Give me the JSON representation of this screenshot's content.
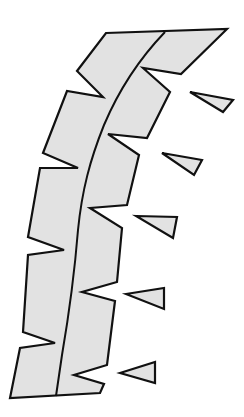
{
  "diagram": {
    "colors": {
      "fill": "#e2e2e2",
      "stroke": "#111111",
      "background": "#ffffff"
    },
    "strip": {
      "outline": "106,33 227,29 181,74 143,68 170,92 147,138 108,134 139,155 127,205 90,208 122,228 117,282 82,292 115,301 107,365 74,375 104,384 100,393 10,398 20,348 55,343 23,332 28,255 64,250 28,237 40,168 78,168 43,153 67,91 103,97 77,71",
      "center_line": "M165,32 C140,58 118,92 104,125 C90,160 82,190 78,230 C74,280 68,320 62,355 L56,396"
    },
    "triangles": [
      {
        "points": "190,92 233,100 223,112"
      },
      {
        "points": "162,153 202,160 194,175"
      },
      {
        "points": "136,216 177,217 173,238"
      },
      {
        "points": "126,294 164,288 164,309"
      },
      {
        "points": "120,373 155,362 155,383"
      }
    ]
  }
}
